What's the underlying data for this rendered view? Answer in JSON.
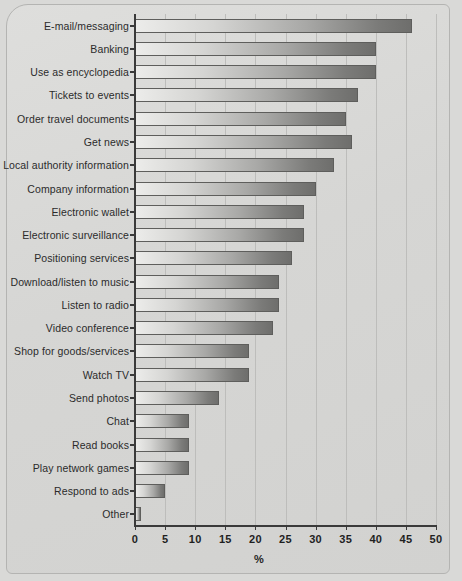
{
  "chart_data": {
    "type": "bar",
    "orientation": "horizontal",
    "title": "",
    "xlabel": "%",
    "ylabel": "",
    "xlim": [
      0,
      50
    ],
    "xticks": [
      0,
      5,
      10,
      15,
      20,
      25,
      30,
      35,
      40,
      45,
      50
    ],
    "grid": "vertical",
    "legend": "none",
    "categories": [
      "E-mail/messaging",
      "Banking",
      "Use as encyclopedia",
      "Tickets to events",
      "Order travel documents",
      "Get news",
      "Local authority information",
      "Company information",
      "Electronic wallet",
      "Electronic surveillance",
      "Positioning services",
      "Download/listen to music",
      "Listen to radio",
      "Video conference",
      "Shop for goods/services",
      "Watch TV",
      "Send photos",
      "Chat",
      "Read books",
      "Play network games",
      "Respond to ads",
      "Other"
    ],
    "values": [
      46,
      40,
      40,
      37,
      35,
      36,
      33,
      30,
      28,
      28,
      26,
      24,
      24,
      23,
      19,
      19,
      14,
      9,
      9,
      9,
      5,
      1
    ]
  },
  "colors": {
    "background": "#d9d9d7",
    "bar_light": "#ececea",
    "bar_dark": "#6e6e6c",
    "axis": "#3a3a3a",
    "grid": "#bdbdbb",
    "text": "#1f1f1f"
  }
}
